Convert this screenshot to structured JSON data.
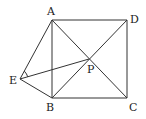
{
  "figure": {
    "points": {
      "A": {
        "label": "A",
        "x": 52,
        "y": 20
      },
      "B": {
        "label": "B",
        "x": 52,
        "y": 98
      },
      "C": {
        "label": "C",
        "x": 127,
        "y": 98
      },
      "D": {
        "label": "D",
        "x": 127,
        "y": 20
      },
      "P": {
        "label": "P",
        "x": 89,
        "y": 59
      },
      "E": {
        "label": "E",
        "x": 20,
        "y": 79
      }
    },
    "segments": [
      "AB",
      "BC",
      "CD",
      "DA",
      "AC",
      "BD",
      "EA",
      "EB",
      "EP"
    ],
    "angle_marks": [
      "AEP"
    ]
  }
}
